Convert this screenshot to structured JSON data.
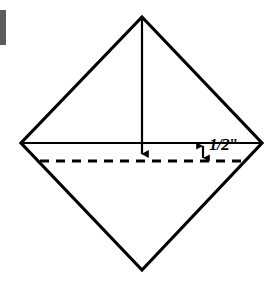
{
  "figure": {
    "background_color": "#ffffff",
    "stroke_color": "#000000",
    "margin_bar_color": "#5c5c5c",
    "canvas": {
      "width": 277,
      "height": 284
    },
    "shapes": {
      "diamond": {
        "name": "diamond-outline",
        "vertices": [
          {
            "label": "top",
            "x": 142,
            "y": 17
          },
          {
            "label": "right",
            "x": 262,
            "y": 143
          },
          {
            "label": "bottom",
            "x": 142,
            "y": 270
          },
          {
            "label": "left",
            "x": 21,
            "y": 143
          }
        ],
        "stroke_width": 3
      },
      "horizontal_diagonal": {
        "name": "horizontal-diagonal-line",
        "x1": 21,
        "y1": 143,
        "x2": 262,
        "y2": 143,
        "stroke_width": 2,
        "style": "solid"
      },
      "fold_arrow": {
        "name": "fold-direction-arrow",
        "x": 142,
        "y_start": 17,
        "y_end": 161,
        "stroke_width": 2,
        "head": "down"
      },
      "dashed_fold_line": {
        "name": "dashed-fold-line",
        "x1": 40,
        "y1": 161,
        "x2": 243,
        "y2": 161,
        "stroke_width": 3,
        "dash_pattern": "9 7"
      },
      "dimension_arrow": {
        "name": "half-inch-dimension-arrow",
        "x": 203,
        "y_top": 143,
        "y_bottom": 161,
        "stroke_width": 2,
        "heads": "both"
      }
    },
    "labels": {
      "dimension": {
        "numerator": "1",
        "slash": "/",
        "denominator": "2",
        "unit": "\"",
        "full_text": "1/2\""
      }
    }
  }
}
